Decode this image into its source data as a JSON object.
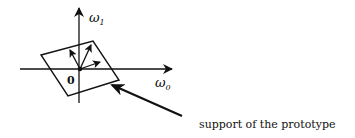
{
  "diagram": {
    "axis_vertical_label": "ω",
    "axis_vertical_subscript": "1",
    "axis_horizontal_label": "ω",
    "axis_horizontal_subscript": "0",
    "origin_label": "0",
    "annotation": "support of the prototype",
    "ink_color": "#111111",
    "background_color": "#ffffff"
  }
}
